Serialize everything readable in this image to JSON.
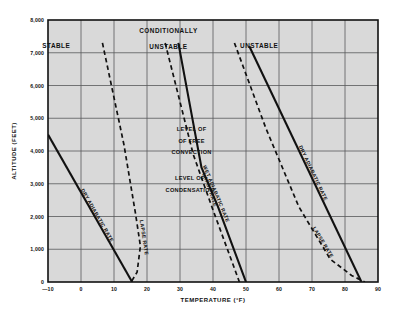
{
  "chart_data": {
    "type": "line",
    "title": "",
    "xlabel": "TEMPERATURE (°F)",
    "ylabel": "ALTITUDE (FEET)",
    "xlim": [
      -10,
      90
    ],
    "ylim": [
      0,
      8000
    ],
    "grid": true,
    "legend_position": "none",
    "xticks": [
      "—10",
      "0",
      "10",
      "20",
      "30",
      "40",
      "50",
      "60",
      "70",
      "80",
      "90"
    ],
    "xtick_values": [
      -10,
      0,
      10,
      20,
      30,
      40,
      50,
      60,
      70,
      80,
      90
    ],
    "yticks": [
      "0",
      "1,000",
      "2,000",
      "3,000",
      "4,000",
      "5,000",
      "6,000",
      "7,000",
      "8,000"
    ],
    "ytick_values": [
      0,
      1000,
      2000,
      3000,
      4000,
      5000,
      6000,
      7000,
      8000
    ],
    "series": [
      {
        "name": "STABLE — DRY ADIABATIC RATE",
        "style": "solid",
        "label": "DRY ADIABATIC RATE",
        "points": [
          [
            -10,
            4500
          ],
          [
            15.5,
            0
          ]
        ]
      },
      {
        "name": "STABLE — LAPSE RATE",
        "style": "dashed",
        "label": "LAPSE RATE",
        "points": [
          [
            6.5,
            7300
          ],
          [
            13,
            4200
          ],
          [
            16.5,
            2100
          ],
          [
            18,
            1100
          ],
          [
            17,
            300
          ],
          [
            15.2,
            0
          ]
        ]
      },
      {
        "name": "CONDITIONALLY UNSTABLE — WET ADIABATIC RATE",
        "style": "solid",
        "label": "WET ADIABATIC RATE",
        "points": [
          [
            29.5,
            7300
          ],
          [
            36.5,
            3500
          ],
          [
            41.5,
            2300
          ],
          [
            50,
            0
          ]
        ]
      },
      {
        "name": "CONDITIONALLY UNSTABLE — LAPSE RATE",
        "style": "dashed",
        "label": "LAPSE RATE",
        "points": [
          [
            25.5,
            7300
          ],
          [
            34,
            3900
          ],
          [
            40,
            2200
          ],
          [
            48,
            0
          ]
        ]
      },
      {
        "name": "UNSTABLE — DRY ADIABATIC RATE",
        "style": "solid",
        "label": "DRY ADIABATIC RATE",
        "points": [
          [
            51,
            7200
          ],
          [
            85,
            0
          ]
        ]
      },
      {
        "name": "UNSTABLE — LAPSE RATE",
        "style": "dashed",
        "label": "LAPSE RATE",
        "points": [
          [
            46.5,
            7300
          ],
          [
            56,
            4700
          ],
          [
            66,
            2300
          ],
          [
            75.5,
            700
          ],
          [
            82,
            200
          ],
          [
            86,
            0
          ]
        ]
      }
    ],
    "region_labels": [
      {
        "text": "STABLE",
        "x": -7.5,
        "y": 7150
      },
      {
        "text": "CONDITIONALLY",
        "x": 26.5,
        "y": 7600
      },
      {
        "text": "UNSTABLE",
        "x": 26.5,
        "y": 7120
      },
      {
        "text": "UNSTABLE",
        "x": 54,
        "y": 7150
      }
    ],
    "annotations": [
      {
        "text": "LEVEL OF",
        "x": 33.5,
        "y": 4600
      },
      {
        "text": "OF FREE",
        "x": 33.5,
        "y": 4250
      },
      {
        "text": "CONVECTION",
        "x": 33.5,
        "y": 3900
      },
      {
        "text": "LEVEL OF",
        "x": 33.0,
        "y": 3100
      },
      {
        "text": "CONDENSATION",
        "x": 33.0,
        "y": 2760
      }
    ]
  },
  "figure": {
    "background": "#ffffff",
    "plot_background": "#d9d9d9",
    "grid_color": "#58595b",
    "line_color": "#111111",
    "frame_color": "#111111"
  }
}
